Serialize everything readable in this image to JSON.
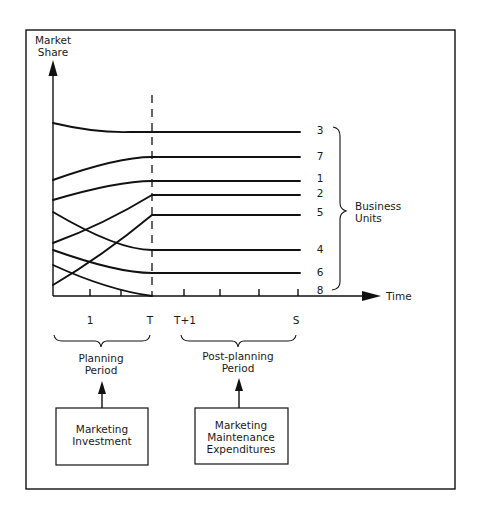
{
  "diagram": {
    "y_axis_label": [
      "Market",
      "Share"
    ],
    "x_axis_label": "Time",
    "time_ticks": [
      {
        "label": "1",
        "x": 90
      },
      {
        "label": "T",
        "x": 152
      },
      {
        "label": "T+1",
        "x": 184
      },
      {
        "label": "S",
        "x": 298
      }
    ],
    "tick_positions": [
      90,
      121,
      152,
      184,
      220,
      259,
      298
    ],
    "business_units_label": [
      "Business",
      "Units"
    ],
    "business_units": [
      {
        "id": "3",
        "start_y": 123,
        "end_y": 132,
        "shape": "decline",
        "label_y": 134
      },
      {
        "id": "7",
        "start_y": 180,
        "end_y": 157,
        "shape": "rise",
        "label_y": 160
      },
      {
        "id": "1",
        "start_y": 200,
        "end_y": 181,
        "shape": "rise",
        "label_y": 182
      },
      {
        "id": "2",
        "start_y": 243,
        "end_y": 195,
        "shape": "rise-linear",
        "label_y": 197
      },
      {
        "id": "5",
        "start_y": 285,
        "end_y": 215,
        "shape": "rise-linear",
        "label_y": 216
      },
      {
        "id": "4",
        "start_y": 212,
        "end_y": 250,
        "shape": "decline",
        "label_y": 253
      },
      {
        "id": "6",
        "start_y": 250,
        "end_y": 273,
        "shape": "decline",
        "label_y": 276
      },
      {
        "id": "8",
        "start_y": 265,
        "end_y": 296,
        "shape": "decline-to-zero",
        "label_y": 294
      }
    ],
    "periods": [
      {
        "name": "planning",
        "label": [
          "Planning",
          "Period"
        ]
      },
      {
        "name": "post-planning",
        "label": [
          "Post-planning",
          "Period"
        ]
      }
    ],
    "boxes": [
      {
        "name": "marketing-investment",
        "lines": [
          "Marketing",
          "Investment"
        ]
      },
      {
        "name": "marketing-maintenance-expenditures",
        "lines": [
          "Marketing",
          "Maintenance",
          "Expenditures"
        ]
      }
    ]
  }
}
